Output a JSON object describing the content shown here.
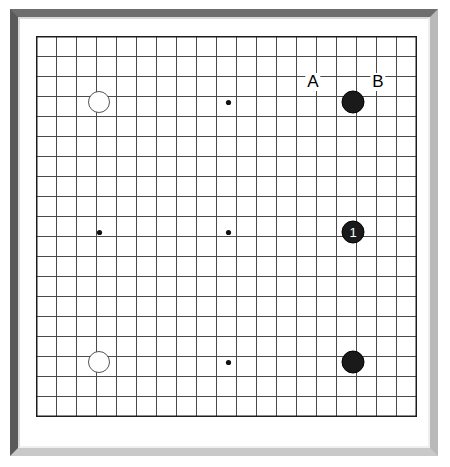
{
  "diagram": {
    "board_size_lines": 20,
    "grid": {
      "origin_x": 36,
      "origin_y": 36,
      "cell": 20,
      "cols": 20,
      "rows": 20,
      "line_color": "#4a4a4a",
      "border_color": "#1c1c1c"
    },
    "frame": {
      "bevel_top_color": "#6e6e6e",
      "bevel_left_color": "#5a5a5a",
      "bevel_right_color": "#b9b9b9",
      "bevel_bottom_color": "#c9c9c9",
      "mat_color": "#ffffff"
    },
    "colors": {
      "black_stone": "#1a1a1a",
      "white_stone": "#ffffff",
      "white_stone_outline": "#555555",
      "label_text": "#000000",
      "stone_number_text": "#ffffff"
    }
  },
  "star_points": [
    {
      "name": "star-point-left-center",
      "cx": 99,
      "cy": 232
    },
    {
      "name": "star-point-center",
      "cx": 228,
      "cy": 232
    },
    {
      "name": "star-point-top-center",
      "cx": 228,
      "cy": 102
    },
    {
      "name": "star-point-bottom-center",
      "cx": 228,
      "cy": 362
    }
  ],
  "stones": [
    {
      "id": "white-1",
      "color": "white",
      "label": "",
      "cx": 99,
      "cy": 102,
      "r": 11
    },
    {
      "id": "white-2",
      "color": "white",
      "label": "",
      "cx": 99,
      "cy": 362,
      "r": 11
    },
    {
      "id": "black-1",
      "color": "black",
      "label": "",
      "cx": 353,
      "cy": 102,
      "r": 11.5
    },
    {
      "id": "black-move-1",
      "color": "black",
      "label": "1",
      "cx": 353,
      "cy": 232,
      "r": 11.5
    },
    {
      "id": "black-3",
      "color": "black",
      "label": "",
      "cx": 353,
      "cy": 362,
      "r": 11.5
    }
  ],
  "point_labels": [
    {
      "id": "label-a",
      "text": "A",
      "cx": 313,
      "cy": 82
    },
    {
      "id": "label-b",
      "text": "B",
      "cx": 378,
      "cy": 82
    }
  ]
}
